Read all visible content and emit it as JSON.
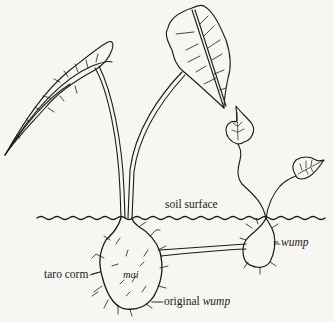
{
  "diagram": {
    "labels": {
      "soil_surface": "soil surface",
      "taro_corm": "taro corm",
      "mai": "mai",
      "original_prefix": "original ",
      "original_wump": "wump",
      "wump": "wump"
    },
    "colors": {
      "ink": "#1a1a1a",
      "paper": "#f7f6f3"
    }
  }
}
